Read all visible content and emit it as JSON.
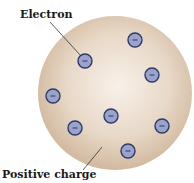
{
  "diagram": {
    "labels": {
      "electron": "Electron",
      "positive_charge": "Positive charge"
    },
    "sphere": {
      "cx": 115,
      "cy": 93,
      "r": 77,
      "color_center": "#f7efe6",
      "color_edge": "#d4bca3"
    },
    "electron_symbol": "−",
    "electron_color": "#9aa3cc",
    "electron_stroke": "#2e3a66",
    "electrons": [
      {
        "x": 85,
        "y": 61
      },
      {
        "x": 135,
        "y": 40
      },
      {
        "x": 152,
        "y": 75
      },
      {
        "x": 53,
        "y": 96
      },
      {
        "x": 111,
        "y": 116
      },
      {
        "x": 75,
        "y": 128
      },
      {
        "x": 162,
        "y": 126
      },
      {
        "x": 128,
        "y": 151
      }
    ]
  }
}
